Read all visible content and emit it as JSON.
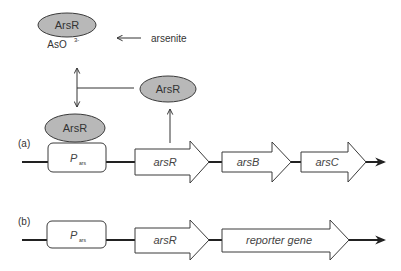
{
  "proteins": {
    "top": "ArsR",
    "right": "ArsR",
    "bound": "ArsR"
  },
  "ligand": {
    "base": "AsO",
    "superscript": "3-"
  },
  "inducer": "arsenite",
  "panel_a": {
    "label": "(a)",
    "promoter": {
      "main": "P",
      "sub": "ars"
    },
    "genes": [
      "arsR",
      "arsB",
      "arsC"
    ]
  },
  "panel_b": {
    "label": "(b)",
    "promoter": {
      "main": "P",
      "sub": "ars"
    },
    "genes": [
      "arsR",
      "reporter gene"
    ]
  },
  "colors": {
    "protein_fill": "#b8b8b8",
    "stroke": "#3a3a3a",
    "dna": "#222222"
  }
}
